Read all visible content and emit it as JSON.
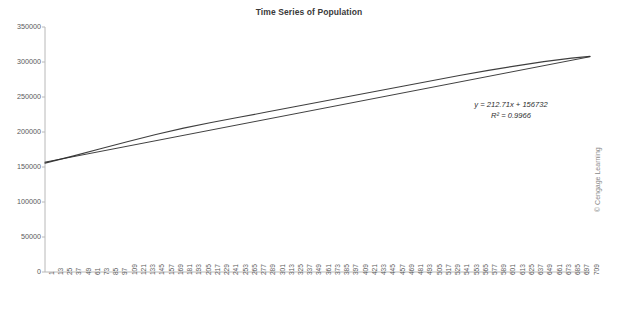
{
  "chart_data": {
    "type": "line",
    "title": "Time Series of Population",
    "xlabel": "",
    "ylabel": "",
    "ylim": [
      0,
      350000
    ],
    "ytick_labels": [
      "350000",
      "300000",
      "250000",
      "200000",
      "150000",
      "100000",
      "50000",
      "0"
    ],
    "ytick_values": [
      350000,
      300000,
      250000,
      200000,
      150000,
      100000,
      50000,
      0
    ],
    "grid": false,
    "legend": "none",
    "xlim": [
      1,
      709
    ],
    "xtick_labels": [
      "1",
      "13",
      "25",
      "37",
      "49",
      "61",
      "73",
      "85",
      "97",
      "109",
      "121",
      "133",
      "145",
      "157",
      "169",
      "181",
      "193",
      "205",
      "217",
      "229",
      "241",
      "253",
      "265",
      "277",
      "289",
      "301",
      "313",
      "325",
      "337",
      "349",
      "361",
      "373",
      "385",
      "397",
      "409",
      "421",
      "433",
      "445",
      "457",
      "469",
      "481",
      "493",
      "505",
      "517",
      "529",
      "541",
      "553",
      "565",
      "577",
      "589",
      "601",
      "613",
      "625",
      "637",
      "649",
      "661",
      "673",
      "685",
      "697",
      "709"
    ],
    "series": [
      {
        "name": "Population",
        "color": "#3f3f3f",
        "x": [
          1,
          37,
          73,
          109,
          145,
          181,
          217,
          253,
          289,
          325,
          361,
          397,
          433,
          469,
          505,
          541,
          577,
          613,
          649,
          685,
          709
        ],
        "values": [
          155500,
          165500,
          176000,
          186500,
          196500,
          205500,
          213500,
          221000,
          228500,
          236000,
          243500,
          251000,
          258500,
          266000,
          273500,
          281000,
          288000,
          294500,
          300500,
          305500,
          308000
        ]
      },
      {
        "name": "Linear Trendline",
        "color": "#2b2b2b",
        "x": [
          1,
          709
        ],
        "values": [
          156945,
          307534
        ]
      }
    ],
    "annotations": [
      {
        "id": "trend-equation",
        "text": "y = 212.71x + 156732"
      },
      {
        "id": "r-squared",
        "text": "R² = 0.9966"
      }
    ]
  },
  "credit": "© Cengage Learning"
}
